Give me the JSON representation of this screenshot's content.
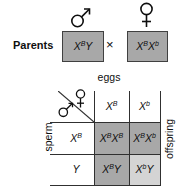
{
  "figure": {
    "parents_label": "Parents",
    "cross_symbol": "×",
    "eggs_label": "eggs",
    "sperm_label": "sperm",
    "offspring_label": "offspring"
  },
  "genotypes": {
    "male_parent": {
      "p1": "X",
      "s1": "B",
      "p2": "Y",
      "s2": ""
    },
    "female_parent": {
      "p1": "X",
      "s1": "B",
      "p2": "X",
      "s2": "b"
    },
    "egg_headers": [
      {
        "p1": "X",
        "s1": "B"
      },
      {
        "p1": "X",
        "s1": "b"
      }
    ],
    "sperm_headers": [
      {
        "p1": "X",
        "s1": "B"
      },
      {
        "p1": "Y",
        "s1": ""
      }
    ],
    "offspring_cells": [
      {
        "p1": "X",
        "s1": "B",
        "p2": "X",
        "s2": "B",
        "shade": "dark"
      },
      {
        "p1": "X",
        "s1": "B",
        "p2": "X",
        "s2": "b",
        "shade": "dark"
      },
      {
        "p1": "X",
        "s1": "B",
        "p2": "Y",
        "s2": "",
        "shade": "dark"
      },
      {
        "p1": "X",
        "s1": "b",
        "p2": "Y",
        "s2": "",
        "shade": "light"
      }
    ]
  },
  "icons": {
    "male_parent_icon": "male-sign",
    "female_parent_icon": "female-sign",
    "corner_male_icon": "male-sign",
    "corner_female_icon": "female-sign"
  },
  "colors": {
    "box_fill": "#a8a8a8",
    "dark_cell": "#a8a8a8",
    "light_cell": "#d4d4d4",
    "box_border": "#404040",
    "grid_line": "#303030",
    "background": "#ffffff",
    "text": "#0f0f0f"
  }
}
